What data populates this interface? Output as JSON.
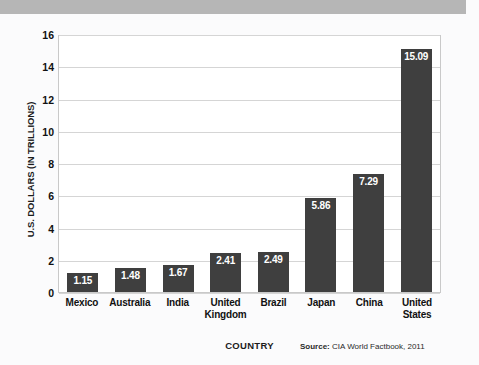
{
  "decor": {
    "top_band_color": "#b6b6b6"
  },
  "chart_data": {
    "type": "bar",
    "title": "",
    "xlabel": "COUNTRY",
    "ylabel": "U.S. DOLLARS (IN TRILLIONS)",
    "categories": [
      "Mexico",
      "Australia",
      "India",
      "United Kingdom",
      "Brazil",
      "Japan",
      "China",
      "United States"
    ],
    "category_lines": [
      [
        "Mexico"
      ],
      [
        "Australia"
      ],
      [
        "India"
      ],
      [
        "United",
        "Kingdom"
      ],
      [
        "Brazil"
      ],
      [
        "Japan"
      ],
      [
        "China"
      ],
      [
        "United",
        "States"
      ]
    ],
    "values": [
      1.15,
      1.48,
      1.67,
      2.41,
      2.49,
      5.86,
      7.29,
      15.09
    ],
    "value_labels": [
      "1.15",
      "1.48",
      "1.67",
      "2.41",
      "2.49",
      "5.86",
      "7.29",
      "15.09"
    ],
    "ylim": [
      0,
      16
    ],
    "yticks": [
      0,
      2,
      4,
      6,
      8,
      10,
      12,
      14,
      16
    ],
    "ytick_labels": [
      "0",
      "2",
      "4",
      "6",
      "8",
      "10",
      "12",
      "14",
      "16"
    ],
    "grid": true,
    "legend": false,
    "bar_color": "#3f3f3f",
    "value_label_color": "#ffffff",
    "plot_bg": "#ffffff",
    "grid_color": "#d5d5d5",
    "source_label": "Source:",
    "source_text": "CIA World Factbook, 2011"
  }
}
